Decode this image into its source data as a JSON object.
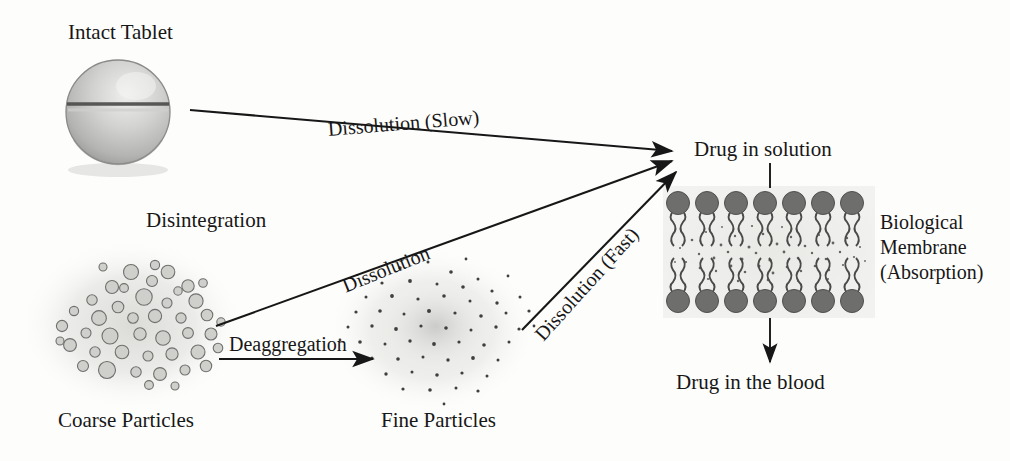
{
  "diagram": {
    "title_semantic": "drug-dissolution-absorption-pathway",
    "colors": {
      "background": "#fdfdfc",
      "ink": "#171717",
      "tablet_fill": "#c9c9c9",
      "tablet_shadow": "#8e8e8e",
      "particle_halo": "#e2e2e0",
      "lipid_head": "#6b6b6b",
      "lipid_tail": "#4a4a4a"
    },
    "nodes": {
      "intact_tablet": "Intact Tablet",
      "coarse_particles": "Coarse Particles",
      "fine_particles": "Fine Particles",
      "drug_in_solution": "Drug in solution",
      "drug_in_blood": "Drug in the blood",
      "biological_membrane_line1": "Biological",
      "biological_membrane_line2": "Membrane",
      "biological_membrane_line3": "(Absorption)"
    },
    "arrows": {
      "disintegration": "Disintegration",
      "deaggregation": "Deaggregation",
      "dissolution_slow": "Dissolution (Slow)",
      "dissolution_medium": "Dissolution",
      "dissolution_fast": "Dissolution (Fast)"
    },
    "membrane": {
      "heads_per_row": 7,
      "rows": 2
    }
  }
}
